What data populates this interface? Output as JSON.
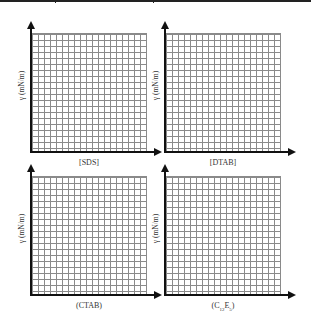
{
  "figure": {
    "panels": [
      {
        "id": "sds",
        "ylabel": "γ (mN/m)",
        "xlabel": "[SDS]"
      },
      {
        "id": "dtab",
        "ylabel": "γ (mN/m)",
        "xlabel": "[DTAB]"
      },
      {
        "id": "ctab",
        "ylabel": "γ (mN/m)",
        "xlabel": "(CTAB)"
      },
      {
        "id": "c12e5",
        "ylabel": "γ (mN/m)",
        "xlabel_main": "(C",
        "xlabel_sub1": "12",
        "xlabel_mid": "E",
        "xlabel_sub2": "5",
        "xlabel_end": ")"
      }
    ],
    "grid": {
      "rows": 20,
      "cols": 19,
      "line_color": "#8a8a8a",
      "axis_color": "#111111"
    }
  }
}
